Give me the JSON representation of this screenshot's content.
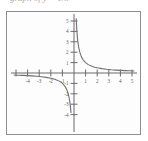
{
  "caption": {
    "text": "graph of y = 1/x"
  },
  "chart_data": {
    "type": "line",
    "title": "",
    "xlabel": "",
    "ylabel": "",
    "xlim": [
      -5.4,
      5.4
    ],
    "ylim": [
      -5.2,
      5.6
    ],
    "grid": false,
    "legend": "none",
    "axes_color": "#6b6b6b",
    "curve_color": "#6f6f6f",
    "frame_color": "#8e8e8e",
    "background": "#fdfdfd",
    "function": "y = 1/x",
    "asymptotes": {
      "vertical": 0,
      "horizontal": 0
    },
    "xticks": [
      -5,
      -4,
      -3,
      -2,
      -1,
      1,
      2,
      3,
      4,
      5
    ],
    "xticklabels": [
      "-5",
      "-4",
      "-3",
      "-2",
      "-1",
      "1",
      "2",
      "3",
      "4",
      "5"
    ],
    "xticklabels_shown": [
      "-4",
      "-3",
      "-2",
      "-1",
      "1",
      "2",
      "3",
      "4",
      "5"
    ],
    "yticks": [
      -4,
      -3,
      -2,
      -1,
      1,
      2,
      3,
      4,
      5
    ],
    "yticklabels": [
      "-4",
      "-3",
      "-2",
      "-1",
      "1",
      "2",
      "3",
      "4",
      "5"
    ],
    "series": [
      {
        "name": "branch-quadrant-I",
        "x": [
          0.19,
          0.22,
          0.25,
          0.3,
          0.35,
          0.4,
          0.5,
          0.6,
          0.7,
          0.8,
          0.9,
          1.0,
          1.2,
          1.4,
          1.6,
          1.8,
          2.0,
          2.4,
          2.8,
          3.2,
          3.6,
          4.0,
          4.4,
          4.8,
          5.2
        ],
        "y": [
          5.26,
          4.55,
          4.0,
          3.33,
          2.86,
          2.5,
          2.0,
          1.67,
          1.43,
          1.25,
          1.11,
          1.0,
          0.83,
          0.71,
          0.63,
          0.56,
          0.5,
          0.42,
          0.36,
          0.31,
          0.28,
          0.25,
          0.23,
          0.21,
          0.19
        ]
      },
      {
        "name": "branch-quadrant-III",
        "x": [
          -5.2,
          -4.8,
          -4.4,
          -4.0,
          -3.6,
          -3.2,
          -2.8,
          -2.4,
          -2.0,
          -1.8,
          -1.6,
          -1.4,
          -1.2,
          -1.0,
          -0.9,
          -0.8,
          -0.7,
          -0.6,
          -0.5,
          -0.4,
          -0.35,
          -0.3,
          -0.26
        ],
        "y": [
          -0.19,
          -0.21,
          -0.23,
          -0.25,
          -0.28,
          -0.31,
          -0.36,
          -0.42,
          -0.5,
          -0.56,
          -0.63,
          -0.71,
          -0.83,
          -1.0,
          -1.11,
          -1.25,
          -1.43,
          -1.67,
          -2.0,
          -2.5,
          -2.86,
          -3.33,
          -3.85
        ]
      }
    ]
  }
}
